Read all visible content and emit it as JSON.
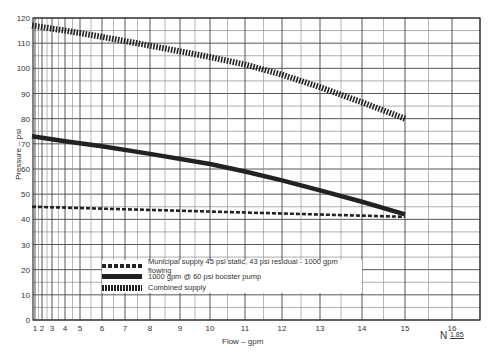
{
  "chart_data": {
    "type": "line",
    "title": "",
    "xlabel": "Flow – gpm",
    "ylabel": "Pressure – psi",
    "x_scale": "N^1.85 hydraulic graph paper",
    "x_scale_label": "N",
    "x_scale_exponent": "1.85",
    "x_ticks": [
      "1",
      "2",
      "3",
      "4",
      "5",
      "6",
      "7",
      "8",
      "9",
      "10",
      "11",
      "12",
      "13",
      "14",
      "15",
      "16"
    ],
    "y_ticks": [
      0,
      10,
      20,
      30,
      40,
      50,
      60,
      70,
      80,
      90,
      100,
      110,
      120
    ],
    "ylim": [
      0,
      120
    ],
    "xlim": [
      0,
      16.5
    ],
    "grid": true,
    "legend_position": "lower-left inside plot",
    "series": [
      {
        "name": "Municipal supply 45 psi static, 43 psi residual - 1000 gpm flowing",
        "style": "dashed",
        "x": [
          0,
          15
        ],
        "y": [
          45,
          41
        ]
      },
      {
        "name": "1000 gpm @ 60 psi booster pump",
        "style": "solid-thick",
        "x": [
          0,
          4,
          6,
          8,
          10,
          11,
          12,
          13,
          14,
          15
        ],
        "y": [
          73,
          71,
          69,
          66,
          62,
          59,
          55.5,
          51.5,
          47,
          42
        ]
      },
      {
        "name": "Combined supply",
        "style": "hatched",
        "x": [
          0,
          4,
          6,
          8,
          10,
          11,
          12,
          13,
          14,
          15
        ],
        "y": [
          117,
          115,
          112.5,
          109,
          104.5,
          101.5,
          97.5,
          92.5,
          86.5,
          80
        ]
      }
    ]
  },
  "labels": {
    "ylabel": "Pressure – psi",
    "xlabel": "Flow – gpm",
    "n_mark": "N",
    "n_exp": "1.85"
  },
  "legend": [
    {
      "label": "Municipal supply 45 psi static, 43 psi residual - 1000 gpm flowing"
    },
    {
      "label": "1000 gpm @ 60 psi booster pump"
    },
    {
      "label": "Combined supply"
    }
  ]
}
